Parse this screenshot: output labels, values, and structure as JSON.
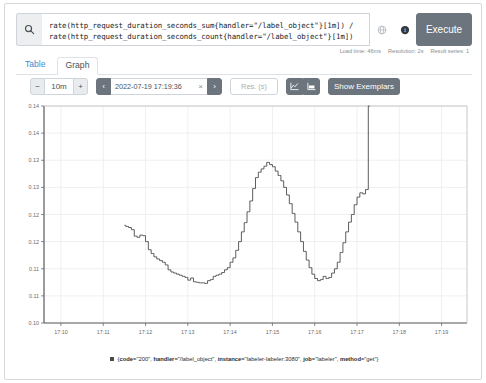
{
  "query": {
    "line1": "rate(http_request_duration_seconds_sum{handler=\"/label_object\"}[1m]) /",
    "line2": "rate(http_request_duration_seconds_count{handler=\"/label_object\"}[1m])",
    "search_icon": "search-icon",
    "metrics_explorer_icon": "globe-icon",
    "help_icon": "info-icon",
    "execute_label": "Execute"
  },
  "stats": {
    "load_time": "Load time: 46ms",
    "resolution": "Resolution: 2s",
    "result_series": "Result series: 1"
  },
  "tabs": [
    {
      "label": "Table",
      "active": false
    },
    {
      "label": "Graph",
      "active": true
    }
  ],
  "toolbar": {
    "range_decrease": "−",
    "range_value": "10m",
    "range_increase": "+",
    "nav_prev": "‹",
    "end_time": "2022-07-19 17:19:36",
    "clear_time": "×",
    "nav_next": "›",
    "resolution_placeholder": "Res. (s)",
    "resolution_value": "",
    "chart_type_line_icon": "line-chart-icon",
    "chart_type_stacked_icon": "stacked-chart-icon",
    "show_exemplars_label": "Show Exemplars"
  },
  "legend": {
    "swatch_color": "#4b4b4b",
    "prefix": "{",
    "suffix": "}",
    "labels": [
      {
        "key": "code",
        "value": "\"200\""
      },
      {
        "key": "handler",
        "value": "\"/label_object\""
      },
      {
        "key": "instance",
        "value": "\"labeler-labeler:3080\""
      },
      {
        "key": "job",
        "value": "\"labeler\""
      },
      {
        "key": "method",
        "value": "\"get\""
      }
    ],
    "full_text": "{code=\"200\", handler=\"/label_object\", instance=\"labeler-labeler:3080\", job=\"labeler\", method=\"get\"}"
  },
  "chart_data": {
    "type": "line",
    "title": "",
    "xlabel": "",
    "ylabel": "",
    "grid": true,
    "legend_position": "bottom",
    "line_color": "#4b4b4b",
    "xlim": [
      "17:09:36",
      "17:19:36"
    ],
    "ylim": [
      0.1,
      0.14
    ],
    "yticks": [
      0.1,
      0.105,
      0.11,
      0.115,
      0.12,
      0.125,
      0.13,
      0.135,
      0.14
    ],
    "ytick_labels": [
      "0.10",
      "0.11",
      "0.11",
      "0.12",
      "0.12",
      "0.13",
      "0.13",
      "0.14",
      "0.14"
    ],
    "xticks": [
      "17:10",
      "17:11",
      "17:12",
      "17:13",
      "17:14",
      "17:15",
      "17:16",
      "17:17",
      "17:18",
      "17:19"
    ],
    "series": [
      {
        "name": "{code=\"200\", handler=\"/label_object\", instance=\"labeler-labeler:3080\", job=\"labeler\", method=\"get\"}",
        "x": [
          "17:11:30",
          "17:11:34",
          "17:11:38",
          "17:11:42",
          "17:11:46",
          "17:11:50",
          "17:11:54",
          "17:11:58",
          "17:12:02",
          "17:12:06",
          "17:12:10",
          "17:12:14",
          "17:12:18",
          "17:12:22",
          "17:12:26",
          "17:12:30",
          "17:12:34",
          "17:12:38",
          "17:12:42",
          "17:12:46",
          "17:12:50",
          "17:12:54",
          "17:12:58",
          "17:13:02",
          "17:13:06",
          "17:13:10",
          "17:13:14",
          "17:13:18",
          "17:13:22",
          "17:13:26",
          "17:13:30",
          "17:13:34",
          "17:13:38",
          "17:13:42",
          "17:13:46",
          "17:13:50",
          "17:13:54",
          "17:13:58",
          "17:14:02",
          "17:14:06",
          "17:14:10",
          "17:14:14",
          "17:14:18",
          "17:14:22",
          "17:14:26",
          "17:14:30",
          "17:14:34",
          "17:14:38",
          "17:14:42",
          "17:14:46",
          "17:14:50",
          "17:14:54",
          "17:14:58",
          "17:15:02",
          "17:15:06",
          "17:15:10",
          "17:15:14",
          "17:15:18",
          "17:15:22",
          "17:15:26",
          "17:15:30",
          "17:15:34",
          "17:15:38",
          "17:15:42",
          "17:15:46",
          "17:15:50",
          "17:15:54",
          "17:15:58",
          "17:16:02",
          "17:16:06",
          "17:16:10",
          "17:16:14",
          "17:16:18",
          "17:16:22",
          "17:16:26",
          "17:16:30",
          "17:16:34",
          "17:16:38",
          "17:16:42",
          "17:16:46",
          "17:16:50",
          "17:16:54",
          "17:16:58",
          "17:17:02",
          "17:17:06",
          "17:17:10",
          "17:17:14",
          "17:17:18"
        ],
        "values": [
          0.118,
          0.1178,
          0.1176,
          0.1172,
          0.116,
          0.1158,
          0.1162,
          0.1161,
          0.115,
          0.1135,
          0.1128,
          0.1122,
          0.1118,
          0.1115,
          0.1112,
          0.1107,
          0.1098,
          0.1094,
          0.1092,
          0.109,
          0.1088,
          0.1086,
          0.1084,
          0.1079,
          0.1083,
          0.1076,
          0.1075,
          0.1074,
          0.1074,
          0.1073,
          0.1078,
          0.108,
          0.1086,
          0.1088,
          0.109,
          0.1093,
          0.1098,
          0.1102,
          0.1112,
          0.112,
          0.1134,
          0.115,
          0.1168,
          0.1185,
          0.1205,
          0.1225,
          0.1248,
          0.1268,
          0.1278,
          0.1284,
          0.1289,
          0.1296,
          0.1292,
          0.1288,
          0.128,
          0.1272,
          0.1262,
          0.125,
          0.1236,
          0.122,
          0.1202,
          0.1186,
          0.1168,
          0.115,
          0.1132,
          0.1116,
          0.1102,
          0.109,
          0.1082,
          0.1078,
          0.108,
          0.1086,
          0.1082,
          0.1084,
          0.1092,
          0.11,
          0.1112,
          0.113,
          0.1148,
          0.1168,
          0.1186,
          0.12,
          0.1218,
          0.1232,
          0.124,
          0.1238,
          0.1246,
          0.14
        ]
      }
    ]
  }
}
